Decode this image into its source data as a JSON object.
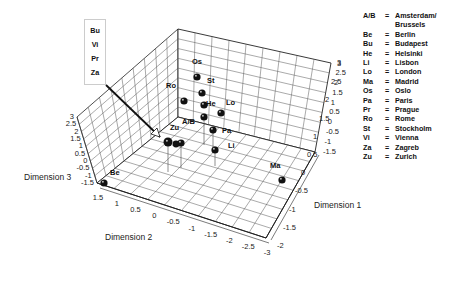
{
  "chart_data": {
    "type": "scatter3d",
    "title": "",
    "axes": {
      "x": {
        "label": "Dimension 1",
        "ticks": [
          "3",
          "2.5",
          "2",
          "1.5",
          "1",
          "0.5",
          "0",
          "-0.5",
          "-1",
          "-1.5",
          "-2"
        ]
      },
      "y": {
        "label": "Dimension 2",
        "ticks": [
          "1.5",
          "1",
          "0.5",
          "0",
          "-0.5",
          "-1",
          "-1.5",
          "-2",
          "-2.5",
          "-3"
        ]
      },
      "z": {
        "label": "Dimension 3",
        "ticks": [
          "3",
          "2.5",
          "2",
          "1.5",
          "1",
          "0.5",
          "0",
          "-0.5",
          "-1",
          "-1.5"
        ]
      },
      "right_wall_ticks": [
        "3",
        "2.5",
        "2",
        "1.5",
        "1",
        "0.5",
        "0",
        "-0.5",
        "-1",
        "-1.5"
      ]
    },
    "points": [
      {
        "label": "Be",
        "x": -1.8,
        "y": 1.5,
        "z": -1.5
      },
      {
        "label": "Ma",
        "x": 0.3,
        "y": -2.8,
        "z": -1.2
      },
      {
        "label": "Os",
        "x": 2.0,
        "y": 0.6,
        "z": 1.5
      },
      {
        "label": "St",
        "x": 1.6,
        "y": 0.4,
        "z": 1.0
      },
      {
        "label": "Ro",
        "x": 1.2,
        "y": 0.5,
        "z": 0.5
      },
      {
        "label": "He",
        "x": 1.1,
        "y": 0.0,
        "z": 0.3
      },
      {
        "label": "Lo",
        "x": 0.8,
        "y": -0.5,
        "z": 0.3
      },
      {
        "label": "A/B",
        "x": 0.5,
        "y": -0.2,
        "z": 0.2
      },
      {
        "label": "Pa",
        "x": 0.3,
        "y": -0.5,
        "z": 0.1
      },
      {
        "label": "Li",
        "x": -0.2,
        "y": -0.6,
        "z": 0.0
      },
      {
        "label": "Zu",
        "x": 0.4,
        "y": 0.4,
        "z": 0.0
      },
      {
        "label": "Bu/Vi/Pr/Za",
        "x": 0.2,
        "y": 0.2,
        "z": 0.0
      }
    ],
    "callout": {
      "labels": [
        "Bu",
        "Vi",
        "Pr",
        "Za"
      ]
    },
    "legend": {
      "position": "right",
      "entries": [
        {
          "abbr": "A/B",
          "name": "Amsterdam/"
        },
        {
          "abbr": "",
          "name": "Brussels"
        },
        {
          "abbr": "Be",
          "name": "Berlin"
        },
        {
          "abbr": "Bu",
          "name": "Budapest"
        },
        {
          "abbr": "He",
          "name": "Helsinki"
        },
        {
          "abbr": "Li",
          "name": "Lisbon"
        },
        {
          "abbr": "Lo",
          "name": "London"
        },
        {
          "abbr": "Ma",
          "name": "Madrid"
        },
        {
          "abbr": "Os",
          "name": "Oslo"
        },
        {
          "abbr": "Pa",
          "name": "Paris"
        },
        {
          "abbr": "Pr",
          "name": "Prague"
        },
        {
          "abbr": "Ro",
          "name": "Rome"
        },
        {
          "abbr": "St",
          "name": "Stockholm"
        },
        {
          "abbr": "Vi",
          "name": "Vienna"
        },
        {
          "abbr": "Za",
          "name": "Zagreb"
        },
        {
          "abbr": "Zu",
          "name": "Zurich"
        }
      ]
    },
    "grid": true
  }
}
